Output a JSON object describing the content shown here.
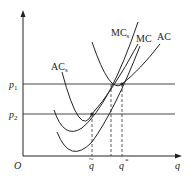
{
  "diagram": {
    "axes": {
      "origin": "O",
      "x_label": "q"
    },
    "prices": [
      {
        "name": "p1",
        "base": "p",
        "sub": "1"
      },
      {
        "name": "p2",
        "base": "p",
        "sub": "2"
      }
    ],
    "quantities": [
      {
        "name": "q-tilde",
        "base": "q",
        "mark": "~"
      },
      {
        "name": "q-star",
        "base": "q",
        "mark": "*"
      }
    ],
    "curves": [
      {
        "name": "MC_s",
        "base": "MC",
        "sub": "s"
      },
      {
        "name": "MC",
        "base": "MC",
        "sub": ""
      },
      {
        "name": "AC",
        "base": "AC",
        "sub": ""
      },
      {
        "name": "AC_s",
        "base": "AC",
        "sub": "s"
      }
    ]
  }
}
